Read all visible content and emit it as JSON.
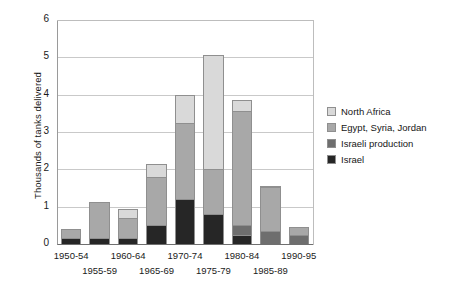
{
  "chart_data": {
    "type": "bar",
    "title": "",
    "subtitle": "",
    "xlabel": "",
    "ylabel": "Thousands of tanks delivered",
    "ylim": [
      0,
      6
    ],
    "ytick_labels": [
      "0",
      "1",
      "2",
      "3",
      "4",
      "5",
      "6"
    ],
    "ytick_values": [
      0,
      1,
      2,
      3,
      4,
      5,
      6
    ],
    "grid": true,
    "stacked": true,
    "legend_position": "right",
    "categories": [
      "1950-54",
      "1955-59",
      "1960-64",
      "1965-69",
      "1970-74",
      "1975-79",
      "1980-84",
      "1985-89",
      "1990-95"
    ],
    "category_rows": [
      "top",
      "bottom",
      "top",
      "bottom",
      "top",
      "bottom",
      "top",
      "bottom",
      "top"
    ],
    "series": [
      {
        "name": "Israel",
        "color": "#262626",
        "values": [
          0.15,
          0.15,
          0.15,
          0.5,
          1.2,
          0.8,
          0.25,
          0.0,
          0.0
        ]
      },
      {
        "name": "Israeli production",
        "color": "#6e6e6e",
        "values": [
          0.0,
          0.0,
          0.0,
          0.0,
          0.0,
          0.0,
          0.25,
          0.35,
          0.25
        ]
      },
      {
        "name": "Egypt, Syria, Jordan",
        "color": "#a8a8a8",
        "values": [
          0.25,
          0.97,
          0.55,
          1.3,
          2.05,
          1.2,
          3.05,
          1.18,
          0.2
        ]
      },
      {
        "name": "North Africa",
        "color": "#d9d9d9",
        "values": [
          0.0,
          0.0,
          0.25,
          0.35,
          0.75,
          3.05,
          0.3,
          0.03,
          0.0
        ]
      }
    ],
    "totals": [
      0.4,
      1.12,
      0.95,
      2.15,
      4.0,
      5.05,
      3.85,
      1.56,
      0.45
    ]
  },
  "legend": {
    "items": [
      {
        "label": "North Africa",
        "color": "#d9d9d9"
      },
      {
        "label": "Egypt, Syria, Jordan",
        "color": "#a8a8a8"
      },
      {
        "label": "Israeli production",
        "color": "#6e6e6e"
      },
      {
        "label": "Israel",
        "color": "#262626"
      }
    ]
  }
}
